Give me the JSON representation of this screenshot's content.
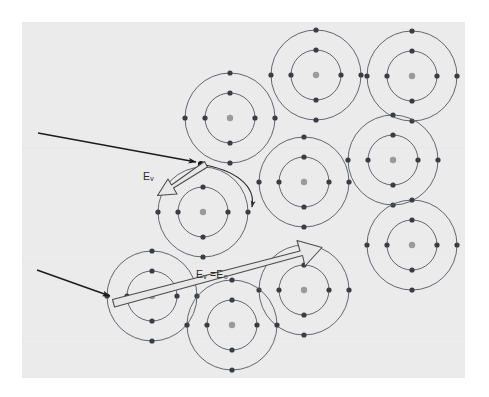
{
  "figure": {
    "kind": "physics-scattering-diagram",
    "panel": {
      "x": 22,
      "y": 22,
      "width": 443,
      "height": 356,
      "fill": "#ebebeb"
    },
    "page_background": "#ffffff"
  },
  "colors": {
    "panel": "#ebebeb",
    "orbit_stroke": "#5b5f66",
    "electron": "#3a3d42",
    "nucleus": "#9a9a9a",
    "ray": "#1c1c1c",
    "block_arrow_stroke": "#4a4a4a",
    "block_arrow_fill": "#e4e4e4",
    "label_text": "#2b2b2b"
  },
  "labels": [
    {
      "id": "ev",
      "base": "E",
      "sub": "v",
      "text": "Eᵥ"
    },
    {
      "id": "ev_e0",
      "base": "E",
      "sub": "v",
      "tail": " =E",
      "sub2": "0",
      "text": "Eᵥ =E₀"
    }
  ],
  "atoms": [
    {
      "id": "atom-1",
      "cx": 230,
      "cy": 118,
      "r_outer": 45,
      "r_inner": 25,
      "electrons_outer": 4,
      "electrons_inner": 4
    },
    {
      "id": "atom-2",
      "cx": 316,
      "cy": 75,
      "r_outer": 45,
      "r_inner": 25,
      "electrons_outer": 4,
      "electrons_inner": 4
    },
    {
      "id": "atom-3",
      "cx": 412,
      "cy": 76,
      "r_outer": 45,
      "r_inner": 25,
      "electrons_outer": 4,
      "electrons_inner": 4
    },
    {
      "id": "atom-4",
      "cx": 393,
      "cy": 160,
      "r_outer": 45,
      "r_inner": 25,
      "electrons_outer": 4,
      "electrons_inner": 4
    },
    {
      "id": "atom-5",
      "cx": 304,
      "cy": 182,
      "r_outer": 45,
      "r_inner": 25,
      "electrons_outer": 4,
      "electrons_inner": 4
    },
    {
      "id": "atom-6",
      "cx": 203,
      "cy": 212,
      "r_outer": 45,
      "r_inner": 25,
      "electrons_outer": 4,
      "electrons_inner": 4
    },
    {
      "id": "atom-7",
      "cx": 412,
      "cy": 245,
      "r_outer": 45,
      "r_inner": 25,
      "electrons_outer": 4,
      "electrons_inner": 4
    },
    {
      "id": "atom-8",
      "cx": 304,
      "cy": 290,
      "r_outer": 45,
      "r_inner": 25,
      "electrons_outer": 4,
      "electrons_inner": 4
    },
    {
      "id": "atom-9",
      "cx": 152,
      "cy": 296,
      "r_outer": 45,
      "r_inner": 25,
      "electrons_outer": 4,
      "electrons_inner": 4
    },
    {
      "id": "atom-10",
      "cx": 232,
      "cy": 325,
      "r_outer": 45,
      "r_inner": 25,
      "electrons_outer": 4,
      "electrons_inner": 4
    }
  ],
  "rays": [
    {
      "id": "incident-ray-upper",
      "type": "thin-arrow",
      "from": {
        "x": 38,
        "y": 133
      },
      "to": {
        "x": 198,
        "y": 163
      },
      "description": "incident particle entering material, strikes atom-6 outer shell"
    },
    {
      "id": "incident-ray-lower",
      "type": "thin-arrow",
      "from": {
        "x": 37,
        "y": 270
      },
      "to": {
        "x": 112,
        "y": 297
      },
      "description": "incident particle entering material, passes through undeflected"
    }
  ],
  "scattered_path": {
    "id": "deflected-path",
    "type": "curved-arrow",
    "from": {
      "x": 200,
      "y": 164
    },
    "to": {
      "x": 252,
      "y": 209
    },
    "description": "deflected trajectory curving around atom-6, energy reduced"
  },
  "block_arrows": [
    {
      "id": "block-arrow-ev",
      "label_id": "ev",
      "description": "short open block arrow pointing back down-left from impact point",
      "tip": {
        "x": 160,
        "y": 196
      },
      "tail": {
        "x": 204,
        "y": 164
      }
    },
    {
      "id": "block-arrow-ev-e0",
      "label_id": "ev_e0",
      "description": "long open block arrow running up-right across the material, unattenuated energy",
      "tail": {
        "x": 112,
        "y": 298
      },
      "tip": {
        "x": 320,
        "y": 243
      }
    }
  ]
}
